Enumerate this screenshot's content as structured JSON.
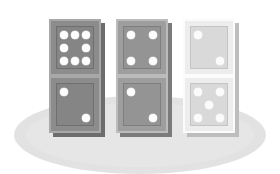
{
  "scene": {
    "title": "Three standing dominoes on a round gray surface",
    "background_color": "#ffffff",
    "ground": {
      "name": "ground-ellipse",
      "color": "#e2e2e2",
      "inner_color": "#e6e6e6"
    }
  },
  "dominoes": [
    {
      "id": "domino-1",
      "position": "left",
      "tone": "dark gray",
      "tile_color": "#8c8c8c",
      "face_color": "#858585",
      "pip_color": "#fdfdfd",
      "shadow_color": "#6d6d6d",
      "top_half": {
        "pip_count": 8,
        "pattern": [
          1,
          1,
          1,
          1,
          0,
          1,
          1,
          1,
          1
        ]
      },
      "bottom_half": {
        "pip_count": 2,
        "pattern": [
          1,
          0,
          0,
          0,
          0,
          0,
          0,
          0,
          1
        ]
      },
      "total_pips": 10
    },
    {
      "id": "domino-2",
      "position": "center",
      "tone": "medium gray",
      "tile_color": "#9e9e9e",
      "face_color": "#949494",
      "pip_color": "#fdfdfd",
      "shadow_color": "#7b7b7b",
      "top_half": {
        "pip_count": 4,
        "pattern": [
          1,
          0,
          1,
          0,
          0,
          0,
          1,
          0,
          1
        ]
      },
      "bottom_half": {
        "pip_count": 2,
        "pattern": [
          1,
          0,
          0,
          0,
          0,
          0,
          0,
          0,
          1
        ]
      },
      "total_pips": 6
    },
    {
      "id": "domino-3",
      "position": "right",
      "tone": "light gray / white",
      "tile_color": "#ededed",
      "face_color": "#d9d9d9",
      "pip_color": "#fbfbfb",
      "shadow_color": "#bdbdbd",
      "top_half": {
        "pip_count": 2,
        "pattern": [
          1,
          0,
          0,
          0,
          0,
          0,
          0,
          0,
          1
        ]
      },
      "bottom_half": {
        "pip_count": 5,
        "pattern": [
          1,
          0,
          1,
          0,
          1,
          0,
          1,
          0,
          1
        ]
      },
      "total_pips": 7
    }
  ]
}
